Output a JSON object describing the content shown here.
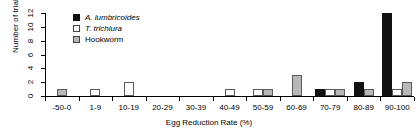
{
  "chart_data": {
    "type": "bar",
    "title": "",
    "subtitle": "",
    "xlabel": "Egg Reduction Rate (%)",
    "ylabel": "Number of trials",
    "categories": [
      "-50-0",
      "1-9",
      "10-19",
      "20-29",
      "30-39",
      "40-49",
      "50-59",
      "60-69",
      "70-79",
      "80-89",
      "90-100"
    ],
    "ylim": [
      0,
      12
    ],
    "yticks": [
      0,
      2,
      4,
      6,
      8,
      10,
      12
    ],
    "grid": false,
    "legend_position": "top-center",
    "series": [
      {
        "name": "A. lumbricoides",
        "key": "sp-al",
        "color": "#111111",
        "italic": true,
        "values": [
          0,
          0,
          0,
          0,
          0,
          0,
          0,
          0,
          1,
          2,
          12
        ]
      },
      {
        "name": "T. trichiura",
        "key": "sp-tt",
        "color": "#ffffff",
        "italic": true,
        "values": [
          0,
          1,
          2,
          0,
          0,
          1,
          1,
          0,
          1,
          0,
          1
        ]
      },
      {
        "name": "Hookworm",
        "key": "sp-hw",
        "color": "#b8b8b8",
        "italic": false,
        "values": [
          1,
          0,
          0,
          0,
          0,
          0,
          1,
          3,
          1,
          1,
          2
        ]
      }
    ]
  },
  "axes": {
    "ytick_labels": [
      "0",
      "2",
      "4",
      "6",
      "8",
      "10",
      "12"
    ],
    "xtick_labels": [
      "-50-0",
      "1-9",
      "10-19",
      "20-29",
      "30-39",
      "40-49",
      "50-59",
      "60-69",
      "70-79",
      "80-89",
      "90-100"
    ],
    "ylabel": "Number of trials",
    "xlabel": "Egg Reduction Rate (%)"
  },
  "legend": {
    "items": [
      {
        "label": "A. lumbricoides",
        "key": "sp-al"
      },
      {
        "label": "T. trichiura",
        "key": "sp-tt"
      },
      {
        "label": "Hookworm",
        "key": "sp-hw"
      }
    ]
  }
}
